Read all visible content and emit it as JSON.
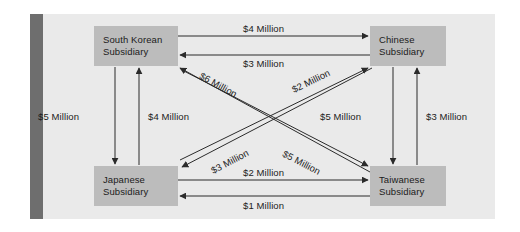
{
  "diagram": {
    "type": "directed-graph",
    "panel_color": "#eaeaea",
    "node_color": "#bcbcbc",
    "spine_color": "#6e6e6e",
    "line_color": "#2b2b2b"
  },
  "nodes": [
    {
      "id": "kr",
      "line1": "South Korean",
      "line2": "Subsidiary"
    },
    {
      "id": "cn",
      "line1": "Chinese",
      "line2": "Subsidiary"
    },
    {
      "id": "jp",
      "line1": "Japanese",
      "line2": "Subsidiary"
    },
    {
      "id": "tw",
      "line1": "Taiwanese",
      "line2": "Subsidiary"
    }
  ],
  "edges": [
    {
      "id": "kr_cn",
      "from": "kr",
      "to": "cn",
      "label": "$4 Million",
      "amount": 4,
      "orientation": "horizontal-top"
    },
    {
      "id": "cn_kr",
      "from": "cn",
      "to": "kr",
      "label": "$3 Million",
      "amount": 3,
      "orientation": "horizontal-top"
    },
    {
      "id": "kr_jp",
      "from": "kr",
      "to": "jp",
      "label": "$5 Million",
      "amount": 5,
      "orientation": "vertical-left"
    },
    {
      "id": "jp_kr",
      "from": "jp",
      "to": "kr",
      "label": "$4 Million",
      "amount": 4,
      "orientation": "vertical-left"
    },
    {
      "id": "cn_tw",
      "from": "cn",
      "to": "tw",
      "label": "$5 Million",
      "amount": 5,
      "orientation": "vertical-right"
    },
    {
      "id": "tw_cn",
      "from": "tw",
      "to": "cn",
      "label": "$3 Million",
      "amount": 3,
      "orientation": "vertical-right"
    },
    {
      "id": "jp_tw",
      "from": "jp",
      "to": "tw",
      "label": "$2 Million",
      "amount": 2,
      "orientation": "horizontal-bottom"
    },
    {
      "id": "tw_jp",
      "from": "tw",
      "to": "jp",
      "label": "$1 Million",
      "amount": 1,
      "orientation": "horizontal-bottom"
    },
    {
      "id": "tw_kr",
      "from": "tw",
      "to": "kr",
      "label": "$6 Million",
      "amount": 6,
      "orientation": "diagonal-down-left"
    },
    {
      "id": "jp_cn",
      "from": "jp",
      "to": "cn",
      "label": "$2 Million",
      "amount": 2,
      "orientation": "diagonal-up-right"
    },
    {
      "id": "cn_jp",
      "from": "cn",
      "to": "jp",
      "label": "$3 Million",
      "amount": 3,
      "orientation": "diagonal-down-left"
    },
    {
      "id": "kr_tw",
      "from": "kr",
      "to": "tw",
      "label": "$5 Million",
      "amount": 5,
      "orientation": "diagonal-down-right"
    }
  ],
  "labels": {
    "top_outer": "$4 Million",
    "top_inner": "$3 Million",
    "diag_kr_in_6": "$6 Million",
    "diag_jp_out_2": "$2 Million",
    "left_outer": "$5 Million",
    "left_inner": "$4 Million",
    "right_inner": "$5 Million",
    "right_outer": "$3 Million",
    "diag_jp_in_3": "$3 Million",
    "diag_tw_in_5": "$5 Million",
    "bottom_inner": "$2 Million",
    "bottom_outer": "$1 Million"
  }
}
